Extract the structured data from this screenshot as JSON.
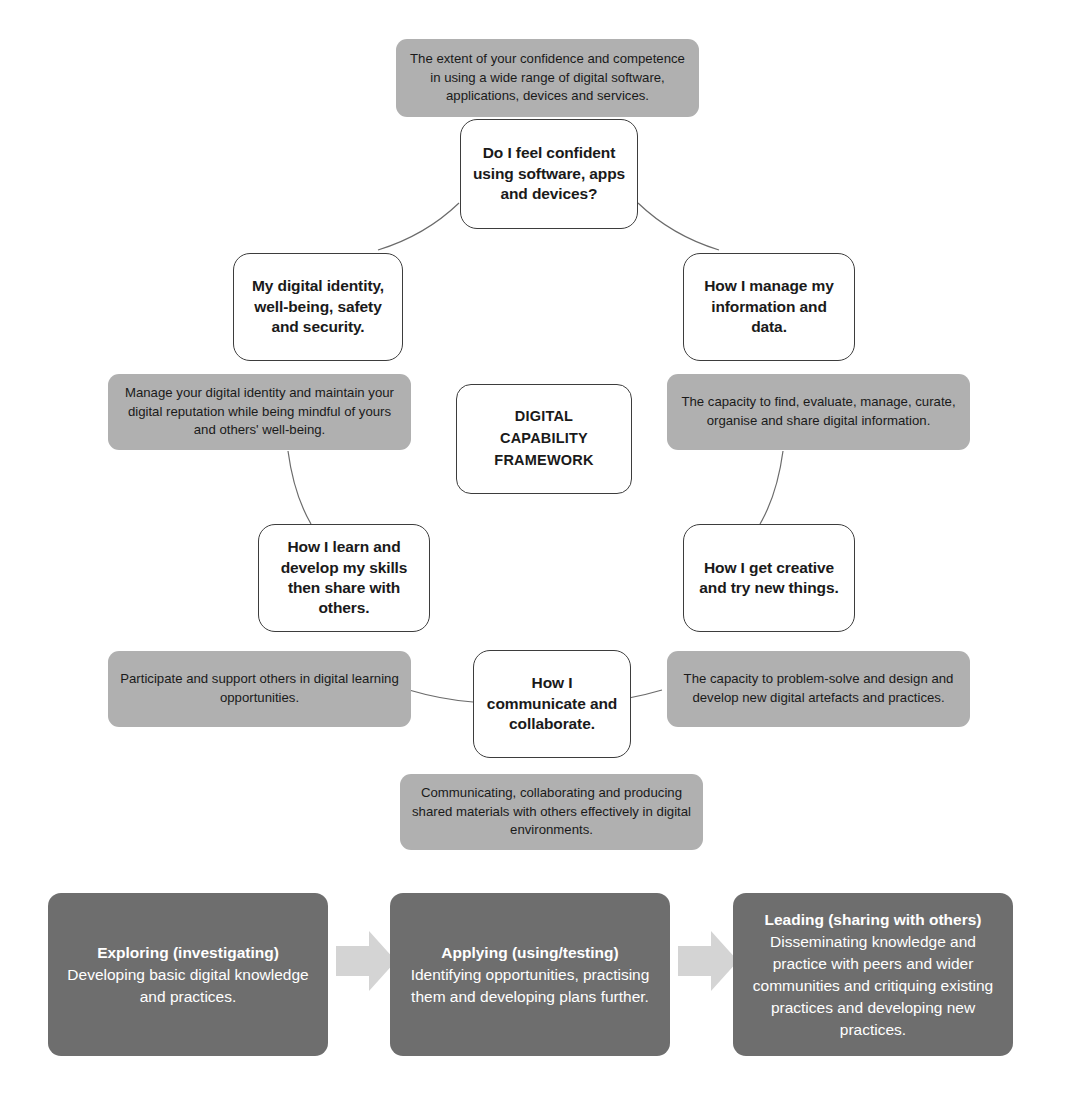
{
  "diagram": {
    "title": "Digital Capability Framework",
    "centre": {
      "label": "DIGITAL\nCAPABILITY\nFRAMEWORK",
      "line1": "DIGITAL",
      "line2": "CAPABILITY",
      "line3": "FRAMEWORK"
    },
    "colors": {
      "node_fill": "#ffffff",
      "node_border": "#3d3d3d",
      "description_fill": "#b0b0b0",
      "stage_fill": "#6e6e6e",
      "stage_text": "#ffffff",
      "arrow_fill": "#d4d4d4",
      "arc_stroke": "#6b6b6b",
      "background": "#ffffff"
    },
    "nodes": [
      {
        "id": "confidence",
        "question": "Do I feel confident using software, apps and devices?",
        "description": "The extent of your confidence and competence in using a wide range of digital software, applications, devices and services."
      },
      {
        "id": "information-data",
        "question": "How I manage my information and data.",
        "description": "The capacity to find, evaluate, manage, curate, organise and share digital information."
      },
      {
        "id": "creative",
        "question": "How I get creative and try new things.",
        "description": "The capacity to problem-solve and design and develop new digital artefacts and practices."
      },
      {
        "id": "communicate",
        "question": "How I communicate and collaborate.",
        "description": "Communicating, collaborating and producing shared materials with others effectively in digital environments."
      },
      {
        "id": "learn-develop",
        "question": "How I learn and develop my skills then share with others.",
        "description": "Participate and support others in digital learning opportunities."
      },
      {
        "id": "identity-wellbeing",
        "question": "My digital identity, well-being, safety and security.",
        "description": "Manage your digital identity and maintain your digital reputation while being mindful of yours and others' well-being."
      }
    ],
    "progression": {
      "stages": [
        {
          "id": "exploring",
          "title": "Exploring (investigating)",
          "body": "Developing basic digital knowledge and practices."
        },
        {
          "id": "applying",
          "title": "Applying (using/testing)",
          "body": "Identifying opportunities, practising them and developing plans further."
        },
        {
          "id": "leading",
          "title": "Leading (sharing with others)",
          "body": "Disseminating knowledge and practice with peers and wider communities and critiquing existing practices and developing new practices."
        }
      ],
      "arrows": [
        {
          "id": "arrow-exploring-to-applying",
          "icon": "arrow-right-icon"
        },
        {
          "id": "arrow-applying-to-leading",
          "icon": "arrow-right-icon"
        }
      ]
    }
  }
}
